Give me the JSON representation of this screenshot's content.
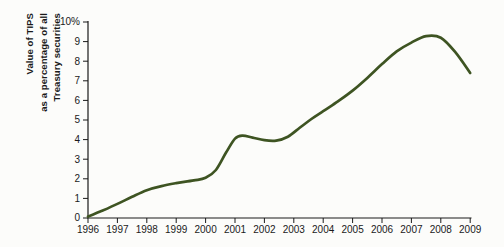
{
  "colors": {
    "background": "#fcfcfa",
    "line": "#3e5422",
    "axis": "#1a1a1a",
    "text": "#1a1a1a"
  },
  "chart_data": {
    "type": "line",
    "title": "",
    "ylabel_lines": [
      "Value of TIPS",
      "as a percentage of all",
      "Treasury securities"
    ],
    "xlabel": "",
    "x_range": [
      1996,
      2009
    ],
    "y_range": [
      0,
      10
    ],
    "grid": false,
    "legend": "none",
    "x_ticks": [
      1996,
      1997,
      1998,
      1999,
      2000,
      2001,
      2002,
      2003,
      2004,
      2005,
      2006,
      2007,
      2008,
      2009
    ],
    "y_ticks": [
      {
        "value": 0,
        "label": "0"
      },
      {
        "value": 1,
        "label": "1"
      },
      {
        "value": 2,
        "label": "2"
      },
      {
        "value": 3,
        "label": "3"
      },
      {
        "value": 4,
        "label": "4"
      },
      {
        "value": 5,
        "label": "5"
      },
      {
        "value": 6,
        "label": "6"
      },
      {
        "value": 7,
        "label": "7"
      },
      {
        "value": 8,
        "label": "8"
      },
      {
        "value": 9,
        "label": "9"
      },
      {
        "value": 10,
        "label": "10%"
      }
    ],
    "series": [
      {
        "name": "Value of TIPS as a percentage of all Treasury securities",
        "color": "#3e5422",
        "points": [
          [
            1996,
            0.07
          ],
          [
            1996.5,
            0.38
          ],
          [
            1997,
            0.72
          ],
          [
            1997.5,
            1.08
          ],
          [
            1998,
            1.42
          ],
          [
            1998.5,
            1.63
          ],
          [
            1999,
            1.78
          ],
          [
            1999.6,
            1.92
          ],
          [
            2000,
            2.05
          ],
          [
            2000.35,
            2.45
          ],
          [
            2000.7,
            3.35
          ],
          [
            2001,
            4.05
          ],
          [
            2001.25,
            4.2
          ],
          [
            2001.6,
            4.1
          ],
          [
            2002,
            3.97
          ],
          [
            2002.4,
            3.95
          ],
          [
            2002.8,
            4.15
          ],
          [
            2003.2,
            4.6
          ],
          [
            2003.6,
            5.05
          ],
          [
            2004,
            5.45
          ],
          [
            2004.5,
            5.95
          ],
          [
            2005,
            6.5
          ],
          [
            2005.5,
            7.15
          ],
          [
            2006,
            7.85
          ],
          [
            2006.5,
            8.5
          ],
          [
            2007,
            8.95
          ],
          [
            2007.5,
            9.28
          ],
          [
            2008,
            9.2
          ],
          [
            2008.5,
            8.45
          ],
          [
            2009,
            7.4
          ]
        ]
      }
    ]
  }
}
